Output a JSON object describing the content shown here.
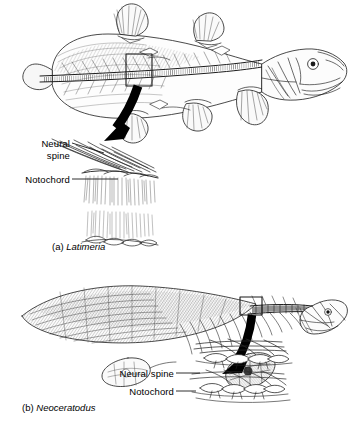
{
  "figure": {
    "background_color": "#ffffff",
    "ink_color": "#1a1a1a",
    "arrow_color": "#000000"
  },
  "panels": [
    {
      "id": "a",
      "caption_prefix": "(a)",
      "caption_taxon": "Latimeria",
      "common_name": "coelacanth",
      "callout_box_label": "vertebral-column-detail-box",
      "arrow_label": "magnification-arrow",
      "labels": [
        {
          "name": "neural-spine",
          "line1": "Neural",
          "line2": "spine",
          "text": "Neural spine"
        },
        {
          "name": "notochord",
          "line1": "Notochord",
          "line2": "",
          "text": "Notochord"
        }
      ]
    },
    {
      "id": "b",
      "caption_prefix": "(b)",
      "caption_taxon": "Neoceratodus",
      "common_name": "lungfish",
      "callout_box_label": "vertebral-column-detail-box",
      "arrow_label": "magnification-arrow",
      "labels": [
        {
          "name": "neural-spine",
          "line1": "Neural spine",
          "line2": "",
          "text": "Neural spine"
        },
        {
          "name": "notochord",
          "line1": "Notochord",
          "line2": "",
          "text": "Notochord"
        }
      ]
    }
  ]
}
